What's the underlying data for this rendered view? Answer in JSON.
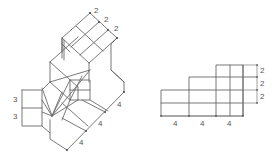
{
  "figure": {
    "left_view": {
      "name": "isometric-view",
      "top_dimensions": [
        "2",
        "2",
        "2"
      ],
      "left_dimensions": [
        "3",
        "3"
      ],
      "bottom_dimensions": [
        "4",
        "4",
        "4"
      ]
    },
    "right_view": {
      "name": "orthographic-view",
      "right_dimensions": [
        "2",
        "2",
        "2"
      ],
      "bottom_dimensions": [
        "4",
        "4",
        "4"
      ]
    }
  }
}
